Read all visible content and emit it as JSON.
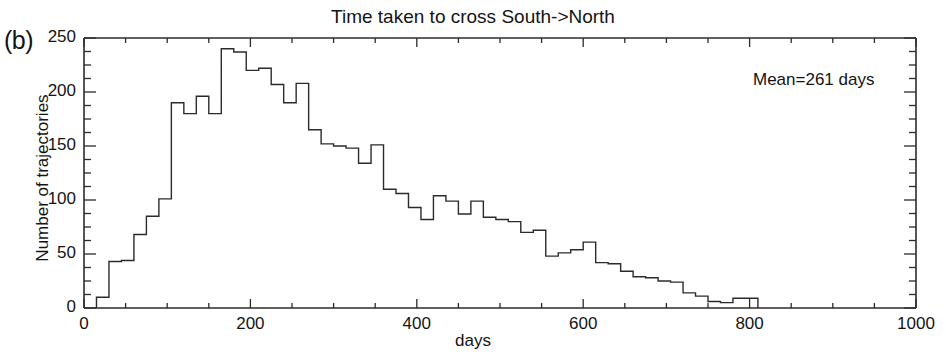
{
  "panel": {
    "label": "(b)"
  },
  "chart_data": {
    "type": "bar",
    "title": "Time taken to cross South->North",
    "xlabel": "days",
    "ylabel": "Number of trajectories",
    "xlim": [
      0,
      1000
    ],
    "ylim": [
      0,
      250
    ],
    "grid": false,
    "legend": "none",
    "bin_width": 15,
    "xticks": [
      0,
      200,
      400,
      600,
      800,
      1000
    ],
    "xtick_labels": [
      "0",
      "200",
      "400",
      "600",
      "800",
      "1000"
    ],
    "yticks": [
      0,
      50,
      100,
      150,
      200,
      250
    ],
    "ytick_labels": [
      "0",
      "50",
      "100",
      "150",
      "200",
      "250"
    ],
    "x_minor_tick_interval": 50,
    "y_minor_tick_interval": 12.5,
    "annotations": [
      {
        "text": "Mean=261 days",
        "x": 780,
        "y": 228
      }
    ],
    "bin_starts": [
      15,
      30,
      45,
      60,
      75,
      90,
      105,
      120,
      135,
      150,
      165,
      180,
      195,
      210,
      225,
      240,
      255,
      270,
      285,
      300,
      315,
      330,
      345,
      360,
      375,
      390,
      405,
      420,
      435,
      450,
      465,
      480,
      495,
      510,
      525,
      540,
      555,
      570,
      585,
      600,
      615,
      630,
      645,
      660,
      675,
      690,
      705,
      720,
      735,
      750,
      765,
      780,
      795
    ],
    "categories": [
      "15-30",
      "30-45",
      "45-60",
      "60-75",
      "75-90",
      "90-105",
      "105-120",
      "120-135",
      "135-150",
      "150-165",
      "165-180",
      "180-195",
      "195-210",
      "210-225",
      "225-240",
      "240-255",
      "255-270",
      "270-285",
      "285-300",
      "300-315",
      "315-330",
      "330-345",
      "345-360",
      "360-375",
      "375-390",
      "390-405",
      "405-420",
      "420-435",
      "435-450",
      "450-465",
      "465-480",
      "480-495",
      "495-510",
      "510-525",
      "525-540",
      "540-555",
      "555-570",
      "570-585",
      "585-600",
      "600-615",
      "615-630",
      "630-645",
      "645-660",
      "660-675",
      "675-690",
      "690-705",
      "705-720",
      "720-735",
      "735-750",
      "750-765",
      "765-780",
      "780-795",
      "795-810"
    ],
    "values": [
      10,
      43,
      44,
      68,
      85,
      101,
      190,
      180,
      196,
      180,
      240,
      237,
      220,
      222,
      207,
      190,
      208,
      165,
      152,
      150,
      148,
      134,
      151,
      110,
      106,
      93,
      82,
      104,
      99,
      87,
      99,
      84,
      82,
      80,
      70,
      72,
      48,
      51,
      54,
      61,
      42,
      41,
      34,
      29,
      28,
      25,
      24,
      14,
      11,
      6,
      5,
      9,
      9
    ],
    "series": [
      {
        "name": "Number of trajectories",
        "values": [
          10,
          43,
          44,
          68,
          85,
          101,
          190,
          180,
          196,
          180,
          240,
          237,
          220,
          222,
          207,
          190,
          208,
          165,
          152,
          150,
          148,
          134,
          151,
          110,
          106,
          93,
          82,
          104,
          99,
          87,
          99,
          84,
          82,
          80,
          70,
          72,
          48,
          51,
          54,
          61,
          42,
          41,
          34,
          29,
          28,
          25,
          24,
          14,
          11,
          6,
          5,
          9,
          9
        ]
      }
    ],
    "line_color": "#2b2b2b",
    "axis_color": "#2b2b2b",
    "background_color": "#ffffff"
  }
}
